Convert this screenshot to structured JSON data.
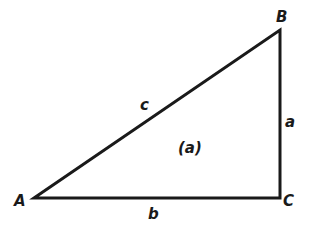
{
  "diagram": {
    "type": "right-triangle",
    "stroke_color": "#1a1a1a",
    "background": "#ffffff",
    "vertices": [
      {
        "name": "A",
        "x": 34,
        "y": 198
      },
      {
        "name": "B",
        "x": 280,
        "y": 30
      },
      {
        "name": "C",
        "x": 280,
        "y": 198
      }
    ],
    "vertex_labels": {
      "A": "A",
      "B": "B",
      "C": "C"
    },
    "side_labels": {
      "a": "a",
      "b": "b",
      "c": "c"
    },
    "figure_label": "(a)",
    "right_angle_at": "C"
  }
}
